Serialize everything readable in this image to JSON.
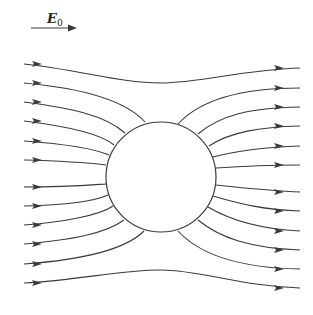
{
  "figure": {
    "field_label": {
      "symbol": "E",
      "subscript": "0"
    },
    "colors": {
      "line": "#3a3a3a",
      "background": "#ffffff"
    },
    "sphere": {
      "cx": 161,
      "cy": 177,
      "r": 55
    },
    "field_arrow": {
      "x1": 31,
      "x2": 77,
      "y": 28
    },
    "field_lines": [
      {
        "id": "upper-1",
        "d": "M24,64 C80,70 120,83 161,83 C200,83 240,70 300,68",
        "arrow_left": [
          38,
          64
        ],
        "arrow_right": [
          280,
          68
        ]
      },
      {
        "id": "upper-2",
        "d": "M24,83 C80,88 125,100 145,122",
        "arrow_left": [
          38,
          83
        ],
        "arrow_right": null
      },
      {
        "id": "upper-3",
        "d": "M24,102 C70,108 105,115 125,133",
        "arrow_left": [
          38,
          102
        ],
        "arrow_right": null
      },
      {
        "id": "upper-4",
        "d": "M24,121 C65,126 100,133 114,145",
        "arrow_left": [
          38,
          121
        ],
        "arrow_right": null
      },
      {
        "id": "upper-5",
        "d": "M24,141 C65,144 95,149 109,155",
        "arrow_left": [
          38,
          141
        ],
        "arrow_right": null
      },
      {
        "id": "upper-6",
        "d": "M24,160 C65,161 90,163 106,165",
        "arrow_left": [
          38,
          160
        ],
        "arrow_right": null
      },
      {
        "id": "lower-6",
        "d": "M24,187 C65,187 90,185 106,184",
        "arrow_left": [
          38,
          187
        ],
        "arrow_right": null
      },
      {
        "id": "lower-5",
        "d": "M24,206 C65,205 95,201 108,195",
        "arrow_left": [
          38,
          206
        ],
        "arrow_right": null
      },
      {
        "id": "lower-4",
        "d": "M24,225 C65,222 100,215 113,206",
        "arrow_left": [
          38,
          225
        ],
        "arrow_right": null
      },
      {
        "id": "lower-3",
        "d": "M24,244 C70,240 105,234 124,220",
        "arrow_left": [
          38,
          244
        ],
        "arrow_right": null
      },
      {
        "id": "lower-2",
        "d": "M24,264 C80,260 125,250 144,231",
        "arrow_left": [
          38,
          264
        ],
        "arrow_right": null
      },
      {
        "id": "lower-1",
        "d": "M24,283 C80,280 120,270 161,270 C200,270 240,286 300,288",
        "arrow_left": [
          38,
          283
        ],
        "arrow_right": [
          280,
          288
        ]
      },
      {
        "id": "right-upper-2",
        "d": "M178,124 C200,100 240,88 300,88",
        "arrow_left": null,
        "arrow_right": [
          280,
          88
        ]
      },
      {
        "id": "right-upper-3",
        "d": "M198,134 C220,115 250,108 300,107",
        "arrow_left": null,
        "arrow_right": [
          280,
          107
        ]
      },
      {
        "id": "right-upper-4",
        "d": "M209,146 C230,132 260,127 300,126",
        "arrow_left": null,
        "arrow_right": [
          280,
          126
        ]
      },
      {
        "id": "right-upper-5",
        "d": "M213,157 C240,150 265,147 300,146",
        "arrow_left": null,
        "arrow_right": [
          280,
          146
        ]
      },
      {
        "id": "right-upper-6",
        "d": "M216,168 C245,166 270,165 300,165",
        "arrow_left": null,
        "arrow_right": [
          280,
          165
        ]
      },
      {
        "id": "right-lower-6",
        "d": "M216,185 C245,188 270,191 300,192",
        "arrow_left": null,
        "arrow_right": [
          280,
          192
        ]
      },
      {
        "id": "right-lower-5",
        "d": "M213,196 C240,204 265,210 300,211",
        "arrow_left": null,
        "arrow_right": [
          280,
          211
        ]
      },
      {
        "id": "right-lower-4",
        "d": "M208,207 C230,220 260,229 300,231",
        "arrow_left": null,
        "arrow_right": [
          280,
          231
        ]
      },
      {
        "id": "right-lower-3",
        "d": "M198,220 C220,238 250,248 300,250",
        "arrow_left": null,
        "arrow_right": [
          280,
          250
        ]
      },
      {
        "id": "right-lower-2",
        "d": "M178,231 C200,255 240,268 300,269",
        "arrow_left": null,
        "arrow_right": [
          280,
          269
        ]
      }
    ]
  }
}
